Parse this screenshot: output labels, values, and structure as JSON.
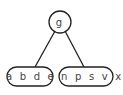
{
  "diagram": {
    "type": "b-tree",
    "root": {
      "keys": "g"
    },
    "children": [
      {
        "keys": "a b d e"
      },
      {
        "keys": "j n p s v x"
      }
    ],
    "colors": {
      "stroke": "#222222",
      "text": "#444444",
      "background": "#ffffff"
    }
  }
}
